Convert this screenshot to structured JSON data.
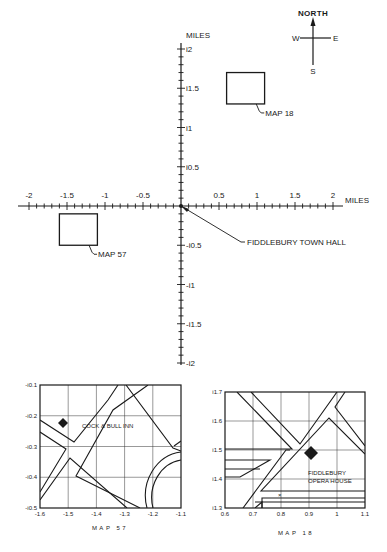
{
  "compass": {
    "north": "NORTH",
    "south": "S",
    "east": "E",
    "west": "W"
  },
  "main_chart": {
    "x_unit": "MILES",
    "y_unit": "MILES",
    "x_ticks": [
      {
        "v": -2,
        "label": "-2"
      },
      {
        "v": -1.5,
        "label": "-1.5"
      },
      {
        "v": -1,
        "label": "-1"
      },
      {
        "v": -0.5,
        "label": "-0.5"
      },
      {
        "v": 0.5,
        "label": "0.5"
      },
      {
        "v": 1,
        "label": "1"
      },
      {
        "v": 1.5,
        "label": "1.5"
      },
      {
        "v": 2,
        "label": "2"
      }
    ],
    "y_ticks": [
      {
        "v": 2,
        "label": "i2"
      },
      {
        "v": 1.5,
        "label": "i1.5"
      },
      {
        "v": 1,
        "label": "i1"
      },
      {
        "v": 0.5,
        "label": "i0.5"
      },
      {
        "v": -0.5,
        "label": "-i0.5"
      },
      {
        "v": -1,
        "label": "-i1"
      },
      {
        "v": -1.5,
        "label": "-i1.5"
      },
      {
        "v": -2,
        "label": "-i2"
      }
    ],
    "minor_step": 0.1,
    "origin_label": "FIDDLEBURY TOWN HALL",
    "regions": [
      {
        "id": "map18",
        "label": "MAP 18",
        "x": [
          0.6,
          1.1
        ],
        "y": [
          1.3,
          1.7
        ]
      },
      {
        "id": "map57",
        "label": "MAP 57",
        "x": [
          -1.6,
          -1.1
        ],
        "y": [
          -0.5,
          -0.1
        ]
      }
    ]
  },
  "map57": {
    "caption": "MAP  57",
    "landmark": "COCK & BULL INN",
    "landmark_at": [
      -1.52,
      -0.3
    ],
    "x_ticks": [
      "-1.6",
      "-1.5",
      "-1.4",
      "-1.3",
      "-1.2",
      "-1.1"
    ],
    "y_ticks": [
      "-i0.1",
      "-i0.2",
      "-i0.3",
      "-i0.4",
      "-i0.5"
    ]
  },
  "map18": {
    "caption": "MAP  18",
    "landmark_line1": "FIDDLEBURY",
    "landmark_line2": "OPERA HOUSE",
    "landmark_at": [
      0.9,
      1.49
    ],
    "x_ticks": [
      "0.6",
      "0.7",
      "0.8",
      "0.9",
      "1",
      "1.1"
    ],
    "y_ticks": [
      "i1.7",
      "i1.6",
      "i1.5",
      "i1.4",
      "i1.3"
    ],
    "small_mark": "×"
  },
  "chart_data": {
    "type": "scatter",
    "title": "",
    "xlabel": "MILES",
    "ylabel": "MILES",
    "xlim": [
      -2,
      2
    ],
    "ylim": [
      -2,
      2
    ],
    "grid": false,
    "points": [
      {
        "label": "FIDDLEBURY TOWN HALL",
        "x": 0,
        "y": 0
      },
      {
        "label": "COCK & BULL INN",
        "x": -1.52,
        "y": -0.3
      },
      {
        "label": "FIDDLEBURY OPERA HOUSE",
        "x": 0.9,
        "y": 1.49
      }
    ],
    "regions": [
      {
        "label": "MAP 18",
        "x": [
          0.6,
          1.1
        ],
        "y": [
          1.3,
          1.7
        ]
      },
      {
        "label": "MAP 57",
        "x": [
          -1.6,
          -1.1
        ],
        "y": [
          -0.5,
          -0.1
        ]
      }
    ]
  }
}
